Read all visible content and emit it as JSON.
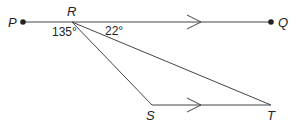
{
  "diagram": {
    "type": "geometry",
    "points": {
      "P": {
        "label": "P",
        "x": 23,
        "y": 22
      },
      "R": {
        "label": "R",
        "x": 72,
        "y": 22
      },
      "Q": {
        "label": "Q",
        "x": 271,
        "y": 22
      },
      "S": {
        "label": "S",
        "x": 152,
        "y": 105
      },
      "T": {
        "label": "T",
        "x": 271,
        "y": 105
      }
    },
    "segments": [
      "PQ",
      "RS",
      "RT",
      "ST"
    ],
    "parallel": [
      "PQ",
      "ST"
    ],
    "angles": {
      "PRS": "135°",
      "QRT": "22°"
    },
    "colors": {
      "stroke": "#333333",
      "text": "#222222"
    }
  }
}
